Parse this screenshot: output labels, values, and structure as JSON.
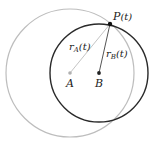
{
  "diagram": {
    "colors": {
      "circle_a": "#bdbdbd",
      "circle_b": "#2a2a2a",
      "radius_a": "#c4c4c4",
      "radius_b": "#555555",
      "point_a": "#b0b0b0",
      "point_b": "#222222",
      "point_p": "#111111"
    },
    "points": {
      "A": {
        "label": "A",
        "x": 70,
        "y": 73
      },
      "B": {
        "label": "B",
        "x": 99,
        "y": 73
      },
      "P": {
        "label_main": "P",
        "label_arg": "(t)",
        "x": 110,
        "y": 24
      }
    },
    "circles": {
      "A": {
        "cx": 70,
        "cy": 73,
        "r": 64
      },
      "B": {
        "cx": 99,
        "cy": 73,
        "r": 49
      }
    },
    "radius_labels": {
      "rA": {
        "main": "r",
        "sub": "A",
        "arg": "(t)"
      },
      "rB": {
        "main": "r",
        "sub": "B",
        "arg": "(t)"
      }
    }
  }
}
